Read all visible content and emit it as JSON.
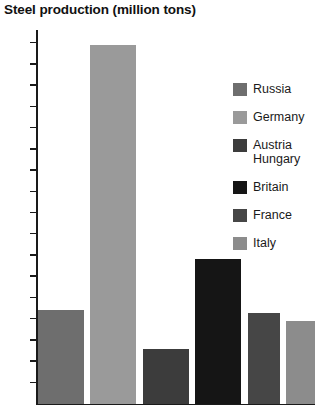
{
  "chart_data": {
    "type": "bar",
    "title": "Steel production (million tons)",
    "xlabel": "",
    "ylabel": "",
    "categories": [
      "Russia",
      "Germany",
      "Austria Hungary",
      "Britain",
      "France",
      "Italy"
    ],
    "values": [
      4.4,
      16.9,
      2.55,
      6.8,
      4.25,
      3.9
    ],
    "ylim": [
      0,
      17.6
    ],
    "yticks": [
      1,
      2,
      3,
      4,
      5,
      6,
      7,
      8,
      9,
      10,
      11,
      12,
      13,
      14,
      15,
      16,
      17
    ],
    "ytick_labels": [
      "1",
      "2",
      "3",
      "4",
      "5",
      "6",
      "7",
      "8",
      "9",
      "10",
      "11",
      "12",
      "13",
      "14",
      "15",
      "16",
      "17"
    ],
    "grid": false,
    "legend_position": "right",
    "series": [
      {
        "name": "Russia",
        "value": 4.4,
        "color": "#6e6e6e"
      },
      {
        "name": "Germany",
        "value": 16.9,
        "color": "#9a9a9a"
      },
      {
        "name": "Austria Hungary",
        "value": 2.55,
        "color": "#3c3c3c",
        "label_line_1": "Austria",
        "label_line_2": "Hungary"
      },
      {
        "name": "Britain",
        "value": 6.8,
        "color": "#151515"
      },
      {
        "name": "France",
        "value": 4.25,
        "color": "#464646"
      },
      {
        "name": "Italy",
        "value": 3.9,
        "color": "#8c8c8c"
      }
    ]
  },
  "legend": {
    "items": [
      {
        "label": "Russia",
        "color": "#6e6e6e"
      },
      {
        "label": "Germany",
        "color": "#9a9a9a"
      },
      {
        "label": "Austria",
        "label2": "Hungary",
        "color": "#3c3c3c"
      },
      {
        "label": "Britain",
        "color": "#151515"
      },
      {
        "label": "France",
        "color": "#464646"
      },
      {
        "label": "Italy",
        "color": "#8c8c8c"
      }
    ]
  },
  "colors": {
    "axis": "#1a1a1a",
    "text": "#1a1a1a",
    "background": "#ffffff"
  }
}
